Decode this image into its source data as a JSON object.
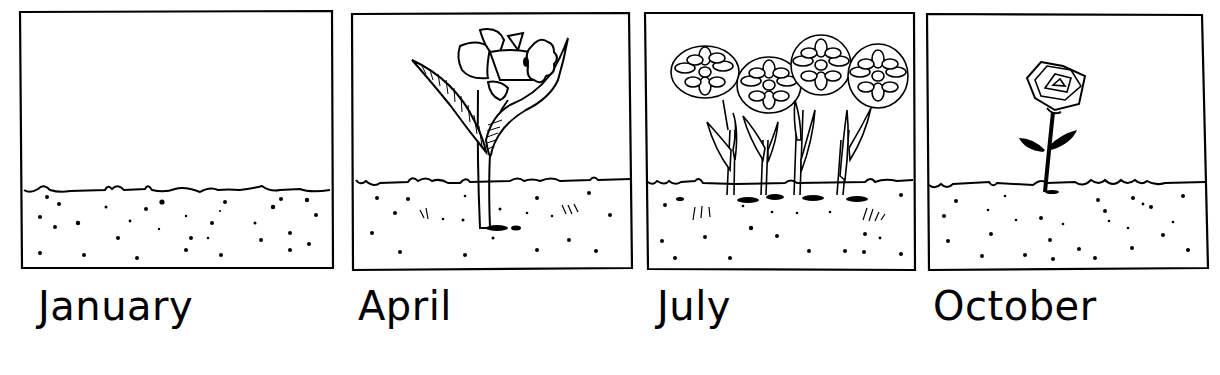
{
  "comic": {
    "panels": [
      {
        "month": "January",
        "scene": "empty ground, no plants"
      },
      {
        "month": "April",
        "scene": "daffodil"
      },
      {
        "month": "July",
        "scene": "four chrysanthemum-like flowers"
      },
      {
        "month": "October",
        "scene": "single rose"
      }
    ]
  },
  "colors": {
    "ink": "#000000",
    "paper": "#ffffff"
  }
}
